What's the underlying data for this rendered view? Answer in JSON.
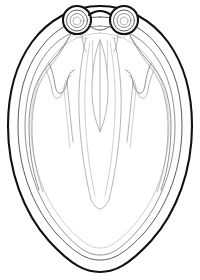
{
  "figure": {
    "canvas": {
      "width": 200,
      "height": 280,
      "background": "#ffffff"
    },
    "style": {
      "outer_outline_color": "#111111",
      "outer_outline_width": 2.1,
      "mid_outline_color": "#5a5a5a",
      "inner_line_color": "#7d7d7d",
      "fine_line_color": "#939393",
      "faint_line_color": "#aeaeae",
      "fill_color": "#ffffff"
    },
    "parts": [
      {
        "id": "outer-mantle-outline",
        "label": "Outer mantle outline",
        "stroke": "#111111"
      },
      {
        "id": "inner-mantle-outline",
        "label": "Inner mantle outline",
        "stroke": "#5a5a5a"
      },
      {
        "id": "left-eye-ring",
        "label": "Left eye ring",
        "stroke": "#111111"
      },
      {
        "id": "right-eye-ring",
        "label": "Right eye ring",
        "stroke": "#111111"
      },
      {
        "id": "inter-ocular-bridge",
        "label": "Inter-ocular bridge",
        "stroke": "#111111"
      },
      {
        "id": "left-lateral-lobe",
        "label": "Left lateral lobe",
        "stroke": "#7d7d7d"
      },
      {
        "id": "right-lateral-lobe",
        "label": "Right lateral lobe",
        "stroke": "#7d7d7d"
      },
      {
        "id": "central-gladius",
        "label": "Central gladius / embryo spindle",
        "stroke": "#939393"
      },
      {
        "id": "central-midrib",
        "label": "Central midrib line",
        "stroke": "#939393"
      },
      {
        "id": "funnel-outline",
        "label": "Funnel outline",
        "stroke": "#939393"
      },
      {
        "id": "left-arm-line",
        "label": "Left arm line",
        "stroke": "#939393"
      },
      {
        "id": "right-arm-line",
        "label": "Right arm line",
        "stroke": "#939393"
      },
      {
        "id": "left-inner-arm-line",
        "label": "Left inner arm line",
        "stroke": "#aeaeae"
      },
      {
        "id": "right-inner-arm-line",
        "label": "Right inner arm line",
        "stroke": "#aeaeae"
      }
    ],
    "geometry": {
      "outer_outline_path": "M 100 6 C 127 6 152 20 168 42 C 184 64 192 93 192 126 C 192 170 177 212 151 241 C 128 266 114 272 100 272 C 86 272 72 266 49 241 C 23 212 8 170 8 126 C 8 93 16 64 32 42 C 48 20 73 6 100 6 Z",
      "inner_outline_path": "M 100 17 C 124 17 146 29 160 49 C 175 69 182 95 182 126 C 182 167 168 205 145 232 C 124 255 112 260 100 260 C 88 260 76 255 55 232 C 32 205 18 167 18 126 C 18 95 25 69 40 49 C 54 29 76 17 100 17 Z",
      "left_eye_center": [
        77,
        20
      ],
      "right_eye_center": [
        124,
        20
      ],
      "eye_outer_radius": 14,
      "eye_rings": [
        14,
        10.5,
        7,
        4
      ],
      "central_spindle_top": [
        100,
        40
      ],
      "central_spindle_bottom": [
        100,
        132
      ],
      "central_funnel_bottom": [
        100,
        208
      ]
    }
  }
}
